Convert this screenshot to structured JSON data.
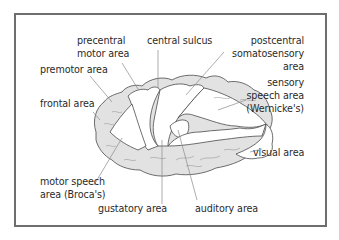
{
  "diagram": {
    "colors": {
      "frame": "#6e6e6e",
      "outline": "#4a4a4a",
      "shaded_cortex": "#e2e2e2",
      "unshaded_region": "#ffffff",
      "leader_line": "#8a8a8a",
      "text": "#2a2a2a"
    },
    "labels": {
      "precentral_motor_area": [
        "precentral",
        "motor area"
      ],
      "central_sulcus": [
        "central sulcus"
      ],
      "postcentral_somatosensory_area": [
        "postcentral",
        "somatosensory",
        "area"
      ],
      "premotor_area": [
        "premotor area"
      ],
      "sensory_speech_area": [
        "sensory",
        "speech area",
        "(Wernicke's)"
      ],
      "frontal_area": [
        "frontal area"
      ],
      "visual_area": [
        "visual area"
      ],
      "motor_speech_area": [
        "motor speech",
        "area (Broca's)"
      ],
      "gustatory_area": [
        "gustatory area"
      ],
      "auditory_area": [
        "auditory area"
      ]
    }
  }
}
